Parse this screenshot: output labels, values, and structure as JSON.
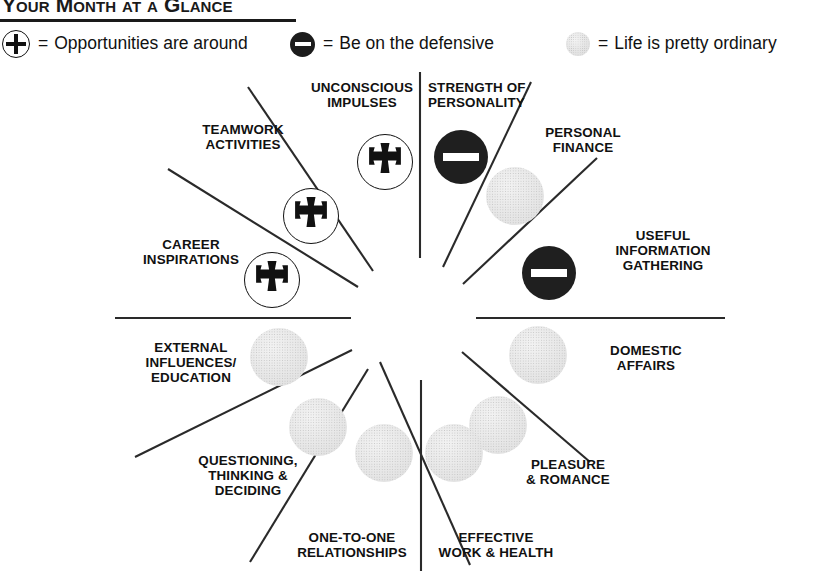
{
  "header": {
    "title": "Your Month at a Glance"
  },
  "legend": {
    "items": [
      {
        "icon": "plus-in-circle-icon",
        "symbol": "+",
        "equals": "=",
        "label": "Opportunities are around"
      },
      {
        "icon": "minus-in-circle-icon",
        "symbol": "–",
        "equals": "=",
        "label": "Be on the defensive"
      },
      {
        "icon": "gray-dotted-circle-icon",
        "symbol": "",
        "equals": "=",
        "label": "Life is pretty ordinary"
      }
    ]
  },
  "wheel": {
    "sectors": [
      {
        "id": "strength-of-personality",
        "label": "STRENGTH OF\nPERSONALITY",
        "status": "defensive"
      },
      {
        "id": "personal-finance",
        "label": "PERSONAL\nFINANCE",
        "status": "ordinary"
      },
      {
        "id": "useful-information-gathering",
        "label": "USEFUL\nINFORMATION\nGATHERING",
        "status": "defensive"
      },
      {
        "id": "domestic-affairs",
        "label": "DOMESTIC\nAFFAIRS",
        "status": "ordinary"
      },
      {
        "id": "pleasure-and-romance",
        "label": "PLEASURE\n& ROMANCE",
        "status": "ordinary"
      },
      {
        "id": "effective-work-and-health",
        "label": "EFFECTIVE\nWORK & HEALTH",
        "status": "ordinary"
      },
      {
        "id": "one-to-one-relationships",
        "label": "ONE-TO-ONE\nRELATIONSHIPS",
        "status": "ordinary"
      },
      {
        "id": "questioning-thinking-deciding",
        "label": "QUESTIONING,\nTHINKING &\nDECIDING",
        "status": "ordinary"
      },
      {
        "id": "external-influences-education",
        "label": "EXTERNAL\nINFLUENCES/\nEDUCATION",
        "status": "ordinary"
      },
      {
        "id": "career-inspirations",
        "label": "CAREER\nINSPIRATIONS",
        "status": "opportunity"
      },
      {
        "id": "teamwork-activities",
        "label": "TEAMWORK\nACTIVITIES",
        "status": "opportunity"
      },
      {
        "id": "unconscious-impulses",
        "label": "UNCONSCIOUS\nIMPULSES",
        "status": "opportunity"
      }
    ]
  },
  "colors": {
    "ink": "#111111",
    "defensive_fill": "#1f1f1f",
    "ordinary_fill": "#e4e4e4",
    "opportunity_fill": "#ffffff",
    "page_background": "#ffffff"
  }
}
